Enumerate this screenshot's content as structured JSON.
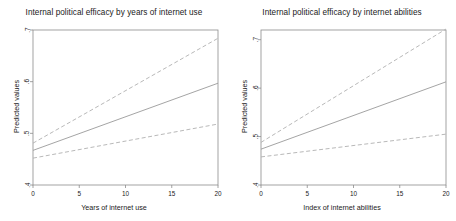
{
  "figure": {
    "y_axis_label": "Predicted values"
  },
  "chart_data": [
    {
      "type": "line",
      "title": "Internal political efficacy by years of internet use",
      "xlabel": "Years of internet use",
      "ylabel": "Predicted values",
      "xlim": [
        0,
        20
      ],
      "ylim": [
        0.4,
        0.7
      ],
      "xticks": [
        "0",
        "5",
        "10",
        "15",
        "20"
      ],
      "xtick_values": [
        0,
        5,
        10,
        15,
        20
      ],
      "yticks": [
        ".4",
        ".5",
        ".6",
        ".7"
      ],
      "ytick_values": [
        0.4,
        0.5,
        0.6,
        0.7
      ],
      "grid": false,
      "legend": "none",
      "x": [
        0,
        20
      ],
      "series": [
        {
          "name": "Predicted value (fit)",
          "style": "solid",
          "color": "#9a9a9a",
          "values": [
            0.467,
            0.597
          ]
        },
        {
          "name": "Upper confidence limit",
          "style": "dashed",
          "color": "#b0b0b0",
          "values": [
            0.481,
            0.684
          ]
        },
        {
          "name": "Lower confidence limit",
          "style": "dashed",
          "color": "#b0b0b0",
          "values": [
            0.452,
            0.518
          ]
        }
      ]
    },
    {
      "type": "line",
      "title": "Internal political efficacy by internet abilities",
      "xlabel": "Index of internet abilities",
      "ylabel": "Predicted values",
      "xlim": [
        0,
        20
      ],
      "ylim": [
        0.4,
        0.72
      ],
      "xticks": [
        "0",
        "5",
        "10",
        "15",
        "20"
      ],
      "xtick_values": [
        0,
        5,
        10,
        15,
        20
      ],
      "yticks": [
        ".4",
        ".5",
        ".6",
        ".7"
      ],
      "ytick_values": [
        0.4,
        0.5,
        0.6,
        0.7
      ],
      "grid": false,
      "legend": "none",
      "x": [
        0,
        20
      ],
      "series": [
        {
          "name": "Predicted value (fit)",
          "style": "solid",
          "color": "#9a9a9a",
          "values": [
            0.474,
            0.613
          ]
        },
        {
          "name": "Upper confidence limit",
          "style": "dashed",
          "color": "#b0b0b0",
          "values": [
            0.488,
            0.722
          ]
        },
        {
          "name": "Lower confidence limit",
          "style": "dashed",
          "color": "#b0b0b0",
          "values": [
            0.458,
            0.505
          ]
        }
      ]
    }
  ]
}
